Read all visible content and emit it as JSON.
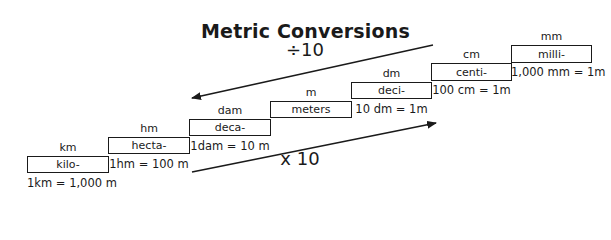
{
  "title": "Metric Conversions",
  "divide_label": "÷10",
  "multiply_label": "x 10",
  "steps": [
    {
      "unit": "km",
      "prefix": "kilo-",
      "equation": "1km = 1,000 m"
    },
    {
      "unit": "hm",
      "prefix": "hecta-",
      "equation": "1hm = 100 m"
    },
    {
      "unit": "dam",
      "prefix": "deca-",
      "equation": "1dam = 10 m"
    },
    {
      "unit": "m",
      "prefix": "meters",
      "equation": ""
    },
    {
      "unit": "dm",
      "prefix": "deci-",
      "equation": "10 dm = 1m"
    },
    {
      "unit": "cm",
      "prefix": "centi-",
      "equation": "100 cm = 1m"
    },
    {
      "unit": "mm",
      "prefix": "milli-",
      "equation": "1,000 mm = 1m"
    }
  ],
  "colors": {
    "line": "#1a1a1a",
    "background": "#ffffff"
  }
}
